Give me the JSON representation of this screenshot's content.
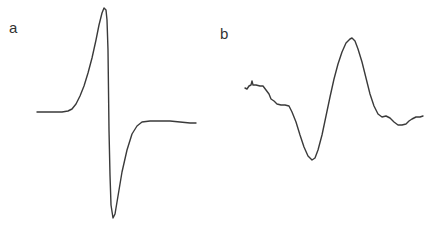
{
  "figure": {
    "panels": [
      {
        "id": "a",
        "label": "a"
      },
      {
        "id": "b",
        "label": "b"
      }
    ],
    "trace_color": "#3a3a3a",
    "background": "#ffffff"
  },
  "chart_data": [
    {
      "type": "line",
      "panel": "a",
      "title": "",
      "xlabel": "",
      "ylabel": "",
      "axes_visible": false,
      "grid": false,
      "description": "Derivative-shaped spectrum: flat baseline, sharp positive peak, steep drop to deep negative trough, recovery to flat baseline slightly below starting level",
      "series": [
        {
          "name": "a",
          "points_px": [
            [
              37,
              112
            ],
            [
              45,
              112
            ],
            [
              55,
              112
            ],
            [
              62,
              112
            ],
            [
              68,
              111
            ],
            [
              72,
              109
            ],
            [
              76,
              104
            ],
            [
              80,
              96
            ],
            [
              84,
              86
            ],
            [
              88,
              73
            ],
            [
              92,
              58
            ],
            [
              96,
              40
            ],
            [
              99,
              25
            ],
            [
              102,
              13
            ],
            [
              104,
              8
            ],
            [
              106,
              10
            ],
            [
              107,
              20
            ],
            [
              108,
              50
            ],
            [
              108.5,
              90
            ],
            [
              109,
              130
            ],
            [
              110,
              175
            ],
            [
              111,
              205
            ],
            [
              113,
              218
            ],
            [
              115,
              214
            ],
            [
              118,
              196
            ],
            [
              122,
              172
            ],
            [
              127,
              150
            ],
            [
              132,
              134
            ],
            [
              137,
              126
            ],
            [
              142,
              122
            ],
            [
              150,
              121
            ],
            [
              160,
              121
            ],
            [
              170,
              121
            ],
            [
              180,
              122
            ],
            [
              190,
              123
            ],
            [
              196,
              123
            ]
          ]
        }
      ],
      "features": {
        "baseline_left_y": 112,
        "peak": {
          "x": 104,
          "y": 8
        },
        "trough": {
          "x": 113,
          "y": 218
        },
        "baseline_right_y": 122
      }
    },
    {
      "type": "line",
      "panel": "b",
      "title": "",
      "xlabel": "",
      "ylabel": "",
      "axes_visible": false,
      "grid": false,
      "description": "Noisier, broader derivative-shaped spectrum: descending shoulder, negative trough, then positive peak, falling to a wavy baseline",
      "series": [
        {
          "name": "b",
          "points_px": [
            [
              245,
              88
            ],
            [
              247,
              89
            ],
            [
              249,
              86
            ],
            [
              251,
              85
            ],
            [
              252,
              81
            ],
            [
              253,
              85
            ],
            [
              256,
              85
            ],
            [
              260,
              86
            ],
            [
              263,
              86
            ],
            [
              266,
              90
            ],
            [
              269,
              94
            ],
            [
              271,
              99
            ],
            [
              274,
              101
            ],
            [
              277,
              104
            ],
            [
              281,
              105
            ],
            [
              285,
              105
            ],
            [
              289,
              106
            ],
            [
              292,
              112
            ],
            [
              296,
              122
            ],
            [
              300,
              135
            ],
            [
              304,
              147
            ],
            [
              308,
              156
            ],
            [
              312,
              160
            ],
            [
              315,
              158
            ],
            [
              318,
              150
            ],
            [
              322,
              135
            ],
            [
              326,
              116
            ],
            [
              330,
              97
            ],
            [
              334,
              79
            ],
            [
              338,
              64
            ],
            [
              342,
              52
            ],
            [
              346,
              43
            ],
            [
              350,
              39
            ],
            [
              352,
              38
            ],
            [
              355,
              41
            ],
            [
              358,
              49
            ],
            [
              362,
              62
            ],
            [
              366,
              78
            ],
            [
              370,
              94
            ],
            [
              374,
              106
            ],
            [
              378,
              114
            ],
            [
              382,
              117
            ],
            [
              386,
              116
            ],
            [
              390,
              118
            ],
            [
              394,
              122
            ],
            [
              398,
              125
            ],
            [
              402,
              125
            ],
            [
              406,
              124
            ],
            [
              409,
              121
            ],
            [
              412,
              119
            ],
            [
              416,
              117
            ],
            [
              420,
              117
            ],
            [
              423,
              116
            ]
          ]
        }
      ],
      "features": {
        "start": {
          "x": 245,
          "y": 88
        },
        "shoulder_y": 105,
        "trough": {
          "x": 312,
          "y": 160
        },
        "peak": {
          "x": 352,
          "y": 38
        },
        "end": {
          "x": 423,
          "y": 116
        }
      }
    }
  ]
}
